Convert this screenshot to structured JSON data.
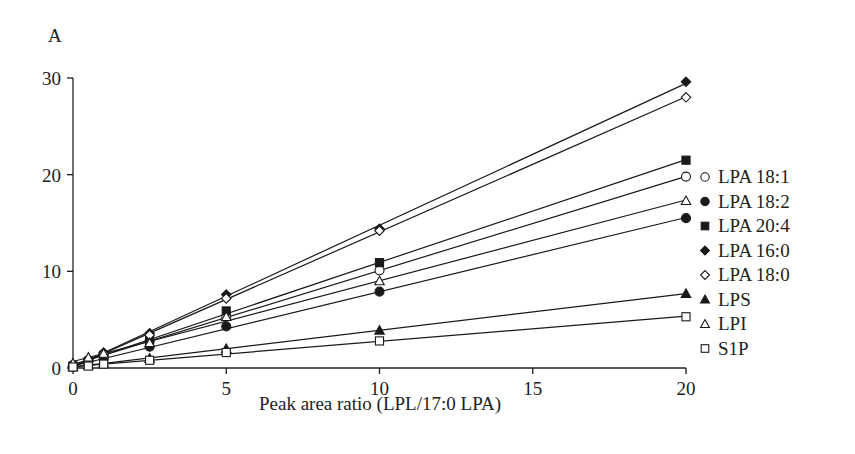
{
  "chart_data": {
    "type": "scatter",
    "panel_label": "A",
    "title": "",
    "xlabel": "Peak area ratio (LPL/17:0 LPA)",
    "ylabel": "",
    "xlim": [
      0,
      20
    ],
    "ylim": [
      0,
      30
    ],
    "xticks": [
      0,
      5,
      10,
      15,
      20
    ],
    "yticks": [
      0,
      10,
      20,
      30
    ],
    "grid": false,
    "legend_position": "right",
    "fit_lines": true,
    "x": [
      0,
      0.5,
      1,
      2.5,
      5,
      10,
      20
    ],
    "series": [
      {
        "name": "LPA 18:1",
        "marker": "circle-open",
        "values": [
          0.3,
          0.8,
          1.3,
          2.8,
          5.3,
          10.1,
          19.8
        ]
      },
      {
        "name": "LPA 18:2",
        "marker": "circle-filled",
        "values": [
          0.1,
          0.5,
          0.9,
          2.2,
          4.3,
          7.9,
          15.5
        ]
      },
      {
        "name": "LPA 20:4",
        "marker": "square-filled",
        "values": [
          0.2,
          0.7,
          1.3,
          3.0,
          5.9,
          10.9,
          21.5
        ]
      },
      {
        "name": "LPA 16:0",
        "marker": "diamond-filled",
        "values": [
          0.2,
          0.9,
          1.6,
          3.6,
          7.6,
          14.4,
          29.6
        ]
      },
      {
        "name": "LPA 18:0",
        "marker": "diamond-open",
        "values": [
          0.2,
          0.8,
          1.5,
          3.4,
          7.2,
          14.2,
          28.0
        ]
      },
      {
        "name": "LPS",
        "marker": "triangle-filled",
        "values": [
          0.1,
          0.3,
          0.5,
          1.0,
          2.0,
          3.9,
          7.7
        ]
      },
      {
        "name": "LPI",
        "marker": "triangle-open",
        "values": [
          0.5,
          1.1,
          1.5,
          2.6,
          5.3,
          9.0,
          17.3
        ]
      },
      {
        "name": "S1P",
        "marker": "square-open",
        "values": [
          0.1,
          0.2,
          0.4,
          0.8,
          1.6,
          2.8,
          5.3
        ]
      }
    ]
  },
  "colors": {
    "ink": "#1a1a1a",
    "background": "#ffffff"
  }
}
